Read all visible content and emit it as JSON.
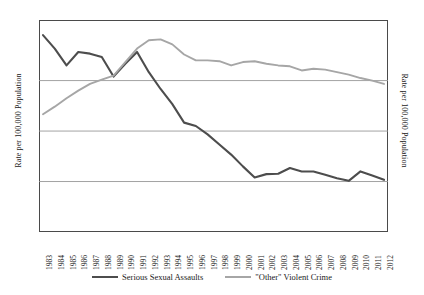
{
  "chart_data": {
    "type": "line",
    "title": "",
    "xlabel": "",
    "ylabel": "Rate per 100,000 Population",
    "ylabel_right": "Rate per 100,000 Population",
    "grid": true,
    "legend_position": "bottom",
    "x": [
      1983,
      1984,
      1985,
      1986,
      1987,
      1988,
      1989,
      1990,
      1991,
      1992,
      1993,
      1994,
      1995,
      1996,
      1997,
      1998,
      1999,
      2000,
      2001,
      2002,
      2003,
      2004,
      2005,
      2006,
      2007,
      2008,
      2009,
      2010,
      2011,
      2012
    ],
    "categories": [
      "1983",
      "1984",
      "1985",
      "1986",
      "1987",
      "1988",
      "1989",
      "1990",
      "1991",
      "1992",
      "1993",
      "1994",
      "1995",
      "1996",
      "1997",
      "1998",
      "1999",
      "2000",
      "2001",
      "2002",
      "2003",
      "2004",
      "2005",
      "2006",
      "2007",
      "2008",
      "2009",
      "2010",
      "2011",
      "2012"
    ],
    "left_axis": {
      "ticks": [
        "6.0",
        "4.5",
        "3.0",
        "1.5"
      ],
      "tick_values": [
        6.0,
        4.5,
        3.0,
        1.5
      ],
      "ylim": [
        0.0,
        6.3
      ]
    },
    "right_axis": {
      "ticks": [
        "1,200",
        "900",
        "600",
        "300"
      ],
      "tick_values": [
        1200,
        900,
        600,
        300
      ],
      "ylim": [
        0,
        1260
      ]
    },
    "series": [
      {
        "name": "Serious Sexual Assaults",
        "axis": "left",
        "color": "#4d4d4d",
        "values": [
          5.85,
          5.45,
          4.95,
          5.35,
          5.3,
          5.2,
          4.62,
          5.0,
          5.35,
          4.75,
          4.25,
          3.8,
          3.25,
          3.15,
          2.9,
          2.6,
          2.3,
          1.95,
          1.62,
          1.72,
          1.73,
          1.9,
          1.8,
          1.8,
          1.7,
          1.6,
          1.52,
          1.8,
          1.68,
          1.55
        ]
      },
      {
        "name": "\"Other\" Violent Crime",
        "axis": "right",
        "color": "#a6a6a6",
        "values": [
          700,
          745,
          795,
          840,
          880,
          905,
          930,
          1010,
          1090,
          1140,
          1145,
          1115,
          1055,
          1020,
          1020,
          1015,
          990,
          1010,
          1015,
          1000,
          990,
          985,
          960,
          970,
          965,
          950,
          935,
          915,
          900,
          880
        ]
      }
    ]
  },
  "legend": [
    {
      "label": "Serious Sexual Assaults",
      "color": "#4d4d4d"
    },
    {
      "label": "\"Other\" Violent Crime",
      "color": "#a6a6a6"
    }
  ],
  "colors": {
    "series_dark": "#4d4d4d",
    "series_light": "#a6a6a6",
    "gridline": "#999999",
    "axis": "#4a4a4a",
    "background": "#ffffff",
    "text": "#1a1a1a"
  }
}
